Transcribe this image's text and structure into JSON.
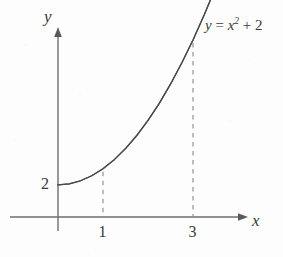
{
  "figure": {
    "background_color": "#fdfdfd",
    "ink_color": "#585858",
    "curve_color": "#4a4a4a",
    "text_color": "#3a3a3a",
    "width": 283,
    "height": 257
  },
  "axes": {
    "y_axis_label": "y",
    "x_axis_label": "x",
    "origin_px": {
      "x": 58,
      "y": 217
    },
    "x_axis_start_px": 10,
    "x_axis_arrow_px": 248,
    "y_axis_arrow_px": 28,
    "y_axis_bottom_px": 231,
    "unit_px": 45
  },
  "curve": {
    "label_y": "y",
    "label_equals": " = ",
    "label_x": "x",
    "label_exponent": "2",
    "label_plus": " + ",
    "label_constant": "2",
    "label_full": "y = x² + 2"
  },
  "ticks": {
    "y": [
      {
        "value": "2",
        "px_y": 181
      }
    ],
    "x": [
      {
        "value": "1",
        "px_x": 103
      },
      {
        "value": "3",
        "px_x": 193
      }
    ]
  },
  "dashed_lines": [
    {
      "at_x": "1",
      "x_px": 104,
      "top_px": 163,
      "bottom_px": 217
    },
    {
      "at_x": "3",
      "x_px": 192,
      "top_px": 62,
      "bottom_px": 217
    }
  ],
  "chart_data": {
    "type": "line",
    "title": "",
    "xlabel": "x",
    "ylabel": "y",
    "function": "y = x^2 + 2",
    "legend": [
      "y = x² + 2"
    ],
    "grid": false,
    "xlim": [
      -1.07,
      4.22
    ],
    "ylim": [
      -0.31,
      11.74
    ],
    "xticks": [
      "1",
      "3"
    ],
    "yticks": [
      "2"
    ],
    "annotations": [
      {
        "text": "y = x² + 2",
        "kind": "curve-label"
      },
      {
        "text": "vertical dashed line at x = 1",
        "kind": "dashed-ordinate"
      },
      {
        "text": "vertical dashed line at x = 3",
        "kind": "dashed-ordinate"
      }
    ],
    "x": [
      0,
      0.25,
      0.5,
      0.75,
      1,
      1.25,
      1.5,
      1.75,
      2,
      2.25,
      2.5,
      2.75,
      3,
      3.25,
      3.45
    ],
    "y": [
      2,
      2.0625,
      2.25,
      2.5625,
      3,
      3.5625,
      4.25,
      5.0625,
      6,
      7.0625,
      8.25,
      9.5625,
      11,
      12.5625,
      13.9
    ],
    "series": [
      {
        "name": "y = x² + 2",
        "values": [
          2,
          2.0625,
          2.25,
          2.5625,
          3,
          3.5625,
          4.25,
          5.0625,
          6,
          7.0625,
          8.25,
          9.5625,
          11,
          12.5625,
          13.9
        ]
      }
    ]
  }
}
